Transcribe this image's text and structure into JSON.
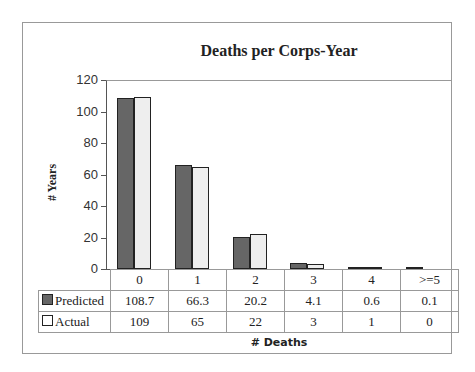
{
  "chart_data": {
    "type": "bar",
    "title": "Deaths per Corps-Year",
    "xlabel": "# Deaths",
    "ylabel": "# Years",
    "ylim": [
      0,
      120
    ],
    "yticks": [
      0,
      20,
      40,
      60,
      80,
      100,
      120
    ],
    "categories": [
      "0",
      "1",
      "2",
      "3",
      "4",
      ">=5"
    ],
    "series": [
      {
        "name": "Predicted",
        "values": [
          108.7,
          66.3,
          20.2,
          4.1,
          0.6,
          0.1
        ],
        "color": "#666666"
      },
      {
        "name": "Actual",
        "values": [
          109,
          65,
          22,
          3,
          1,
          0
        ],
        "color": "#eeeeee"
      }
    ],
    "data_table": true,
    "grid": false,
    "legend_position": "data-table"
  },
  "table": {
    "predicted_label": "Predicted",
    "actual_label": "Actual",
    "predicted_display": [
      "108.7",
      "66.3",
      "20.2",
      "4.1",
      "0.6",
      "0.1"
    ],
    "actual_display": [
      "109",
      "65",
      "22",
      "3",
      "1",
      "0"
    ]
  }
}
